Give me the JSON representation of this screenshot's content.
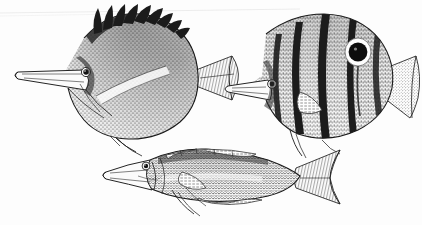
{
  "plate": {
    "title": "Three fish line illustrations",
    "medium": "scanned pen-and-ink scientific illustration",
    "background_color": "#fdfdfd",
    "ink_color": "#1a1a1a",
    "width_px": 422,
    "height_px": 225,
    "border": "none",
    "caption_text": "",
    "label_text": "",
    "scan_artifact": {
      "name": "top-edge-scan-line",
      "description": "faint grey diagonal scan line across upper left",
      "color": "#d8d8d8"
    }
  },
  "figures": [
    {
      "id": "fish-1",
      "name": "longnose-butterflyfish",
      "common_form": "deep-bodied butterflyfish with elongated tubular snout",
      "position": "upper left",
      "bbox": [
        8,
        8,
        240,
        150
      ],
      "orientation": "facing left",
      "features": {
        "snout": "long tubular forceps-like snout",
        "eye": "small round dark eye with pale ring",
        "dorsal_fin": "row of long dark pointed spines along the back",
        "body_texture": "dense fine stippling",
        "dark_margin": "heavy black band along rear dorsal and anal fin margins",
        "caudal_fin": "forked, lightly hatched",
        "pelvic_fins": "two long trailing filaments below body"
      },
      "dorsal_spine_count": 9
    },
    {
      "id": "fish-2",
      "name": "copperband-butterflyfish",
      "common_form": "disc-shaped butterflyfish with vertical bands and eyespot",
      "position": "upper right",
      "bbox": [
        228,
        10,
        194,
        140
      ],
      "orientation": "facing left",
      "features": {
        "snout": "moderately elongated tubular snout",
        "eye": "small eye masked by dark head band",
        "ocellus": "large black eyespot with white ring on rear dorsal fin",
        "body_texture": "fine vertical hatch lines",
        "caudal_fin": "fan-shaped with dark vertical bar at base",
        "anal_fin": "rounded with trailing filament"
      },
      "vertical_band_count": 5
    },
    {
      "id": "fish-3",
      "name": "elongate-wrasse",
      "common_form": "slender elongated fish with pointed snout and forked tail",
      "position": "lower centre",
      "bbox": [
        92,
        140,
        242,
        80
      ],
      "orientation": "facing left",
      "features": {
        "snout": "long pointed conical snout",
        "eye": "small round eye set high on head",
        "body_texture": "coarse imbricate scale stippling",
        "dorsal_fin": "long low fin running most of the back",
        "caudal_fin": "deeply forked with extended upper and lower lobes",
        "pelvic_fins": "short trailing filaments beneath the pectoral"
      }
    }
  ]
}
